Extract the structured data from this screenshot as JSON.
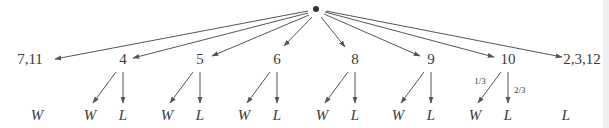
{
  "diagram": {
    "type": "probability-tree",
    "root": {
      "label": "",
      "marker": "dot"
    },
    "first_roll_nodes": [
      {
        "id": "n711",
        "label": "7,11",
        "outcomes": [
          "W"
        ]
      },
      {
        "id": "n4",
        "label": "4",
        "outcomes": [
          "W",
          "L"
        ]
      },
      {
        "id": "n5",
        "label": "5",
        "outcomes": [
          "W",
          "L"
        ]
      },
      {
        "id": "n6",
        "label": "6",
        "outcomes": [
          "W",
          "L"
        ]
      },
      {
        "id": "n8",
        "label": "8",
        "outcomes": [
          "W",
          "L"
        ]
      },
      {
        "id": "n9",
        "label": "9",
        "outcomes": [
          "W",
          "L"
        ]
      },
      {
        "id": "n10",
        "label": "10",
        "outcomes": [
          "W",
          "L"
        ],
        "probabilities": [
          "1/3",
          "2/3"
        ]
      },
      {
        "id": "n2312",
        "label": "2,3,12",
        "outcomes": [
          "L"
        ]
      }
    ]
  }
}
